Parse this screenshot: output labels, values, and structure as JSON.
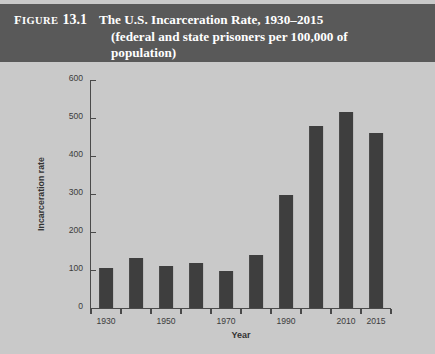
{
  "figure": {
    "label_small": "IGURE",
    "label_first": "F",
    "number": "13.1",
    "title_line1": "The U.S. Incarceration Rate, 1930–2015",
    "title_line2": "(federal and state prisoners per 100,000 of",
    "title_line3": "population)"
  },
  "colors": {
    "header_band": "#595959",
    "figure_background": "#c9c9c9",
    "bar": "#3e3e3e",
    "axis": "#4a4a4a",
    "text_dark": "#333333",
    "text_light": "#ffffff"
  },
  "chart_data": {
    "type": "bar",
    "title": "The U.S. Incarceration Rate, 1930–2015 (federal and state prisoners per 100,000 of population)",
    "xlabel": "Year",
    "ylabel": "Incarceration rate",
    "categories": [
      "1930",
      "1940",
      "1950",
      "1960",
      "1970",
      "1980",
      "1990",
      "2000",
      "2010",
      "2015"
    ],
    "values": [
      105,
      132,
      110,
      118,
      97,
      140,
      297,
      478,
      515,
      460
    ],
    "x_tick_labels": [
      "1930",
      "1950",
      "1970",
      "1990",
      "2010",
      "2015"
    ],
    "y_tick_labels": [
      "0",
      "100",
      "200",
      "300",
      "400",
      "500",
      "600"
    ],
    "y_ticks": [
      0,
      100,
      200,
      300,
      400,
      500,
      600
    ],
    "ylim": [
      0,
      600
    ],
    "grid": false,
    "legend": "none"
  }
}
